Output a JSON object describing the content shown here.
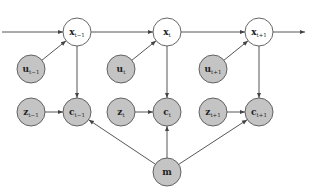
{
  "diagram": {
    "type": "probabilistic graphical model",
    "colors": {
      "observed_fill": "#c4c4c4",
      "latent_fill": "#ffffff",
      "stroke": "#555555",
      "edge": "#444444"
    },
    "nodes": [
      {
        "id": "x_tm1",
        "label": "x",
        "sub": "t−1",
        "cx": 77,
        "cy": 32,
        "observed": false
      },
      {
        "id": "x_t",
        "label": "x",
        "sub": "t",
        "cx": 167,
        "cy": 32,
        "observed": false
      },
      {
        "id": "x_tp1",
        "label": "x",
        "sub": "t+1",
        "cx": 259,
        "cy": 32,
        "observed": false
      },
      {
        "id": "u_tm1",
        "label": "u",
        "sub": "t−1",
        "cx": 31,
        "cy": 69,
        "observed": true
      },
      {
        "id": "u_t",
        "label": "u",
        "sub": "t",
        "cx": 121,
        "cy": 69,
        "observed": true
      },
      {
        "id": "u_tp1",
        "label": "u",
        "sub": "t+1",
        "cx": 213,
        "cy": 69,
        "observed": true
      },
      {
        "id": "z_tm1",
        "label": "z",
        "sub": "t−1",
        "cx": 31,
        "cy": 112,
        "observed": true
      },
      {
        "id": "z_t",
        "label": "z",
        "sub": "t",
        "cx": 121,
        "cy": 112,
        "observed": true
      },
      {
        "id": "z_tp1",
        "label": "z",
        "sub": "t+1",
        "cx": 213,
        "cy": 112,
        "observed": true
      },
      {
        "id": "c_tm1",
        "label": "c",
        "sub": "t−1",
        "cx": 77,
        "cy": 112,
        "observed": true
      },
      {
        "id": "c_t",
        "label": "c",
        "sub": "t",
        "cx": 167,
        "cy": 112,
        "observed": true
      },
      {
        "id": "c_tp1",
        "label": "c",
        "sub": "t+1",
        "cx": 259,
        "cy": 112,
        "observed": true
      },
      {
        "id": "m",
        "label": "m",
        "sub": "",
        "cx": 167,
        "cy": 172,
        "observed": true
      }
    ],
    "edges": [
      [
        "in",
        "x_tm1"
      ],
      [
        "x_tm1",
        "x_t"
      ],
      [
        "x_t",
        "x_tp1"
      ],
      [
        "x_tp1",
        "out"
      ],
      [
        "u_tm1",
        "x_tm1"
      ],
      [
        "u_t",
        "x_t"
      ],
      [
        "u_tp1",
        "x_tp1"
      ],
      [
        "x_tm1",
        "c_tm1"
      ],
      [
        "x_t",
        "c_t"
      ],
      [
        "x_tp1",
        "c_tp1"
      ],
      [
        "z_tm1",
        "c_tm1"
      ],
      [
        "z_t",
        "c_t"
      ],
      [
        "z_tp1",
        "c_tp1"
      ],
      [
        "m",
        "c_tm1"
      ],
      [
        "m",
        "c_t"
      ],
      [
        "m",
        "c_tp1"
      ]
    ]
  }
}
